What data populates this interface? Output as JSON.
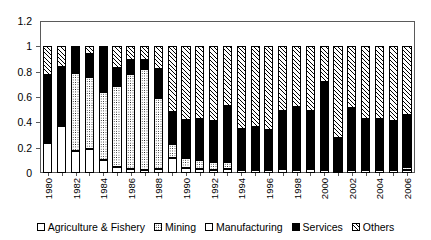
{
  "chart_data": {
    "type": "bar",
    "stacked": true,
    "title": "",
    "xlabel": "",
    "ylabel": "",
    "ylim": [
      0,
      1.2
    ],
    "yticks": [
      "0",
      "0.2",
      "0.4",
      "0.6",
      "0.8",
      "1",
      "1.2"
    ],
    "grid": false,
    "legend_position": "bottom",
    "categories": [
      "1980",
      "1981",
      "1982",
      "1983",
      "1984",
      "1985",
      "1986",
      "1987",
      "1988",
      "1989",
      "1990",
      "1991",
      "1992",
      "1993",
      "1994",
      "1995",
      "1996",
      "1997",
      "1998",
      "1999",
      "2000",
      "2001",
      "2002",
      "2003",
      "2004",
      "2005",
      "2006"
    ],
    "tick_labels": [
      "1980",
      "",
      "1982",
      "",
      "1984",
      "",
      "1986",
      "",
      "1988",
      "",
      "1990",
      "",
      "1992",
      "",
      "1994",
      "",
      "1996",
      "",
      "1998",
      "",
      "2000",
      "",
      "2002",
      "",
      "2004",
      "",
      "2006"
    ],
    "series": [
      {
        "name": "Agriculture & Fishery",
        "values": [
          0.24,
          0.37,
          0.17,
          0.19,
          0.1,
          0.05,
          0.03,
          0.02,
          0.03,
          0.12,
          0.04,
          0.03,
          0.02,
          0.03,
          0.02,
          0.02,
          0.02,
          0.03,
          0.02,
          0.03,
          0.02,
          0.01,
          0.02,
          0.02,
          0.02,
          0.02,
          0.02
        ]
      },
      {
        "name": "Mining",
        "values": [
          0.01,
          0.0,
          0.62,
          0.57,
          0.54,
          0.64,
          0.75,
          0.8,
          0.56,
          0.11,
          0.08,
          0.07,
          0.07,
          0.06,
          0.02,
          0.01,
          0.02,
          0.02,
          0.01,
          0.02,
          0.02,
          0.0,
          0.01,
          0.01,
          0.01,
          0.01,
          0.03
        ]
      },
      {
        "name": "Manufacturing",
        "values": [
          0.0,
          0.0,
          0.0,
          0.0,
          0.0,
          0.0,
          0.0,
          0.0,
          0.0,
          0.0,
          0.0,
          0.0,
          0.0,
          0.0,
          0.0,
          0.0,
          0.0,
          0.0,
          0.0,
          0.0,
          0.0,
          0.0,
          0.0,
          0.0,
          0.0,
          0.0,
          0.0
        ]
      },
      {
        "name": "Services",
        "values": [
          0.52,
          0.47,
          0.21,
          0.18,
          0.35,
          0.14,
          0.11,
          0.07,
          0.23,
          0.25,
          0.3,
          0.33,
          0.32,
          0.44,
          0.31,
          0.33,
          0.3,
          0.44,
          0.49,
          0.44,
          0.68,
          0.26,
          0.48,
          0.39,
          0.39,
          0.38,
          0.41
        ]
      },
      {
        "name": "Others",
        "values": [
          0.23,
          0.16,
          0.0,
          0.06,
          0.01,
          0.17,
          0.11,
          0.11,
          0.18,
          0.52,
          0.58,
          0.57,
          0.59,
          0.47,
          0.65,
          0.64,
          0.66,
          0.51,
          0.48,
          0.51,
          0.28,
          0.73,
          0.49,
          0.58,
          0.58,
          0.59,
          0.54
        ]
      }
    ],
    "series_styles": [
      "white-square",
      "dotted",
      "white-square",
      "black-filled",
      "diagonal-hatch"
    ]
  },
  "legend": {
    "items": [
      {
        "label": "Agriculture & Fishery",
        "swatch": "white-square"
      },
      {
        "label": "Mining",
        "swatch": "dotted"
      },
      {
        "label": "Manufacturing",
        "swatch": "white-square"
      },
      {
        "label": "Services",
        "swatch": "black-filled"
      },
      {
        "label": "Others",
        "swatch": "diagonal-hatch"
      }
    ]
  },
  "colors": {
    "series_black": "#000000",
    "series_white": "#ffffff",
    "axis": "#5a5a5a",
    "background": "#ffffff"
  }
}
